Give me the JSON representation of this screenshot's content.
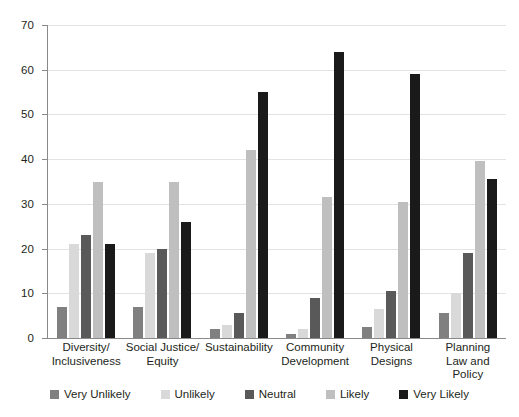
{
  "chart_data": {
    "type": "bar",
    "title": "",
    "subtitle": "",
    "xlabel": "",
    "ylabel": "",
    "ylim": [
      0,
      70
    ],
    "y_ticks": [
      0,
      10,
      20,
      30,
      40,
      50,
      60,
      70
    ],
    "grid": true,
    "legend_position": "bottom",
    "categories": [
      "Diversity/\nInclusiveness",
      "Social Justice/\nEquity",
      "Sustainability",
      "Community\nDevelopment",
      "Physical\nDesigns",
      "Planning\nLaw and\nPolicy"
    ],
    "category_lines": [
      [
        "Diversity/",
        "Inclusiveness"
      ],
      [
        "Social Justice/",
        "Equity"
      ],
      [
        "Sustainability"
      ],
      [
        "Community",
        "Development"
      ],
      [
        "Physical",
        "Designs"
      ],
      [
        "Planning",
        "Law and",
        "Policy"
      ]
    ],
    "series": [
      {
        "name": "Very Unlikely",
        "color": "#808080",
        "values": [
          7,
          7,
          2,
          1,
          2.5,
          5.5
        ]
      },
      {
        "name": "Unlikely",
        "color": "#d9d9d9",
        "values": [
          21,
          19,
          3,
          2,
          6.5,
          10
        ]
      },
      {
        "name": "Neutral",
        "color": "#595959",
        "values": [
          23,
          20,
          5.5,
          9,
          10.5,
          19
        ]
      },
      {
        "name": "Likely",
        "color": "#bfbfbf",
        "values": [
          35,
          35,
          42,
          31.5,
          30.5,
          39.5
        ]
      },
      {
        "name": "Very Likely",
        "color": "#1a1a1a",
        "values": [
          21,
          26,
          55,
          64,
          59,
          35.5
        ]
      }
    ]
  },
  "axis": {
    "axis_color": "#8a8a8a",
    "grid_color": "#e3e3e3",
    "text_color": "#231f20"
  }
}
